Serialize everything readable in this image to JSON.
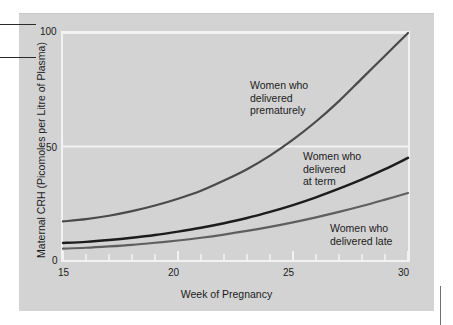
{
  "figure": {
    "background_color": "#d3d3d3",
    "plot_border_color": "#f2f2f2"
  },
  "axes": {
    "y_title": "Maternal CRH (Picomoles per Litre of Plasma)",
    "x_title": "Week of Pregnancy",
    "y_ticks": [
      "100",
      "50",
      "0"
    ],
    "x_ticks": [
      "15",
      "20",
      "25",
      "30"
    ]
  },
  "annotations": {
    "premature": "Women who\ndelivered\nprematurely",
    "term": "Women who\ndelivered\nat term",
    "late": "Women who\ndelivered late"
  },
  "chart_data": {
    "type": "line",
    "title": "",
    "xlabel": "Week of Pregnancy",
    "ylabel": "Maternal CRH (Picomoles per Litre of Plasma)",
    "xlim": [
      15,
      30
    ],
    "ylim": [
      0,
      100
    ],
    "xticks": [
      15,
      20,
      25,
      30
    ],
    "yticks": [
      0,
      50,
      100
    ],
    "xtick_minor_step": 1,
    "grid": "horizontal-white-at-50-and-100",
    "legend": "inline annotations",
    "x": [
      15,
      16,
      17,
      18,
      19,
      20,
      21,
      22,
      23,
      24,
      25,
      26,
      27,
      28,
      29,
      30
    ],
    "series": [
      {
        "name": "Women who delivered prematurely",
        "color": "#4a4a4a",
        "line_width": 2.2,
        "values": [
          17,
          18,
          19.5,
          21.5,
          24,
          27,
          30.5,
          35,
          40,
          46,
          53,
          61,
          70,
          80,
          90,
          100
        ]
      },
      {
        "name": "Women who delivered at term",
        "color": "#1c1c1c",
        "line_width": 2.4,
        "values": [
          7.5,
          8,
          8.8,
          9.8,
          11,
          12.5,
          14.2,
          16.2,
          18.5,
          21.2,
          24.2,
          27.6,
          31.4,
          35.5,
          40,
          45
        ]
      },
      {
        "name": "Women who delivered late",
        "color": "#5f5f5f",
        "line_width": 2.2,
        "values": [
          5,
          5.4,
          6,
          6.7,
          7.6,
          8.6,
          9.8,
          11.2,
          12.8,
          14.6,
          16.6,
          18.8,
          21.2,
          23.8,
          26.6,
          29.5
        ]
      }
    ]
  }
}
